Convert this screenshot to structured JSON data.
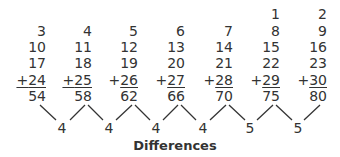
{
  "columns": [
    {
      "values": [
        "",
        "3",
        "10",
        "17"
      ],
      "addend": "24",
      "sum": "54"
    },
    {
      "values": [
        "",
        "4",
        "11",
        "18"
      ],
      "addend": "25",
      "sum": "58"
    },
    {
      "values": [
        "",
        "5",
        "12",
        "19"
      ],
      "addend": "26",
      "sum": "62"
    },
    {
      "values": [
        "",
        "6",
        "13",
        "20"
      ],
      "addend": "27",
      "sum": "66"
    },
    {
      "values": [
        "",
        "7",
        "14",
        "21"
      ],
      "addend": "28",
      "sum": "70"
    },
    {
      "values": [
        "1",
        "8",
        "15",
        "22"
      ],
      "addend": "29",
      "sum": "75"
    },
    {
      "values": [
        "2",
        "9",
        "16",
        "23"
      ],
      "addend": "30",
      "sum": "80"
    }
  ],
  "plus_sign": "+",
  "differences": [
    "4",
    "4",
    "4",
    "4",
    "5",
    "5"
  ],
  "differences_label": "Differences",
  "line_color": "#333333"
}
